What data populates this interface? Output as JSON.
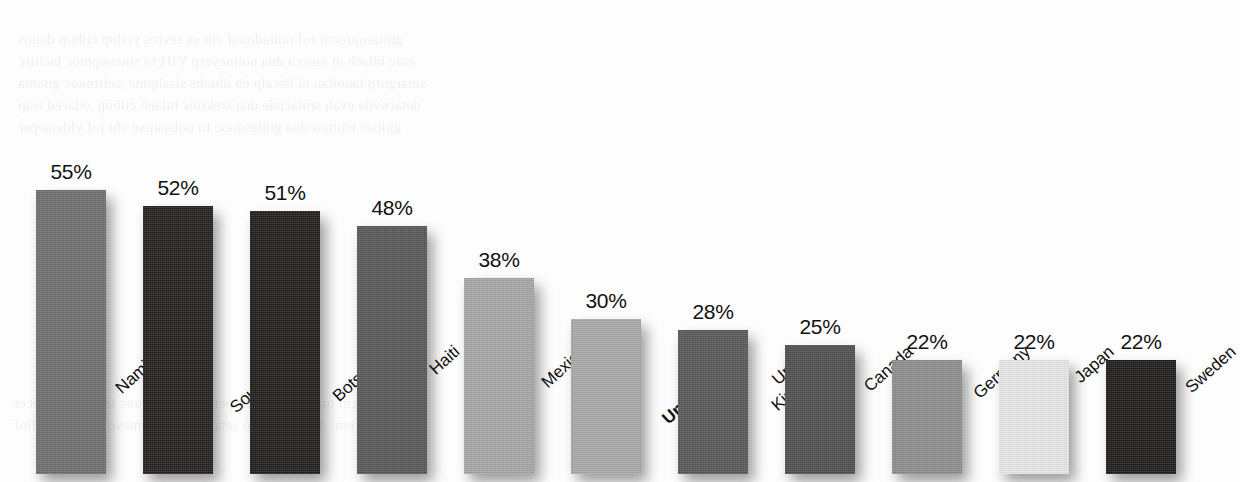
{
  "chart_data": {
    "type": "bar",
    "title": "",
    "subtitle": "",
    "xlabel": "",
    "ylabel": "",
    "ylim": [
      0,
      60
    ],
    "grid": false,
    "legend": "none",
    "value_suffix": "%",
    "categories": [
      "Namibia",
      "South Africa",
      "Botswana",
      "Haiti",
      "Mexico",
      "United States",
      "United Kingdom",
      "Canada",
      "Germany",
      "Japan",
      "Sweden"
    ],
    "values": [
      55,
      52,
      51,
      48,
      38,
      30,
      28,
      25,
      22,
      22,
      22
    ],
    "value_labels": [
      "55%",
      "52%",
      "51%",
      "48%",
      "38%",
      "30%",
      "28%",
      "25%",
      "22%",
      "22%",
      "22%"
    ],
    "bars": [
      {
        "label": "Namibia",
        "value": 55,
        "value_label": "55%",
        "color": "#6f6f6f",
        "emphasis": false,
        "label_lines": "Namibia"
      },
      {
        "label": "South Africa",
        "value": 52,
        "value_label": "52%",
        "color": "#231f1f",
        "emphasis": false,
        "label_lines": "South Africa"
      },
      {
        "label": "Botswana",
        "value": 51,
        "value_label": "51%",
        "color": "#1f1c1c",
        "emphasis": false,
        "label_lines": "Botswana"
      },
      {
        "label": "Haiti",
        "value": 48,
        "value_label": "48%",
        "color": "#575757",
        "emphasis": false,
        "label_lines": "Haiti"
      },
      {
        "label": "Mexico",
        "value": 38,
        "value_label": "38%",
        "color": "#a7a7a7",
        "emphasis": false,
        "label_lines": "Mexico"
      },
      {
        "label": "United States",
        "value": 30,
        "value_label": "30%",
        "color": "#a9a9a9",
        "emphasis": true,
        "label_lines": "United States"
      },
      {
        "label": "United Kingdom",
        "value": 28,
        "value_label": "28%",
        "color": "#585858",
        "emphasis": false,
        "label_lines": "United\nKingdom"
      },
      {
        "label": "Canada",
        "value": 25,
        "value_label": "25%",
        "color": "#4e4e4e",
        "emphasis": false,
        "label_lines": "Canada"
      },
      {
        "label": "Germany",
        "value": 22,
        "value_label": "22%",
        "color": "#8e8e8e",
        "emphasis": false,
        "label_lines": "Germany"
      },
      {
        "label": "Japan",
        "value": 22,
        "value_label": "22%",
        "color": "#e9e9e9",
        "emphasis": false,
        "label_lines": "Japan"
      },
      {
        "label": "Sweden",
        "value": 22,
        "value_label": "22%",
        "color": "#1d1a1a",
        "emphasis": false,
        "label_lines": "Sweden"
      }
    ]
  },
  "layout": {
    "bar_width": 70,
    "bar_pitch": 107,
    "first_bar_left": 36,
    "baseline_y": 320,
    "px_per_unit": 5.16,
    "background": "#fdfdfd",
    "text_color": "#111111"
  }
}
